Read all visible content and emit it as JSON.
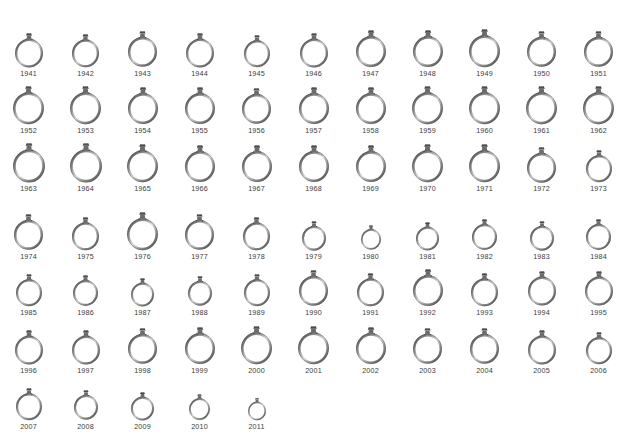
{
  "page": {
    "background_color": "#ffffff",
    "label_color": "#3c3c3c",
    "ring_metal_color": "#8a8a8a",
    "ring_metal_shadow_color": "#4a4a4a",
    "ring_metal_highlight_color": "#d8d8d8",
    "gem_color": "#6b6b6b",
    "item_count": 71,
    "column_count": 11,
    "row_count": 7,
    "year_range_label": "1941-2011"
  },
  "chart_data": {
    "type": "bar",
    "title": "",
    "subtitle": "",
    "xlabel": "",
    "ylabel": "",
    "legend": [],
    "grid": false,
    "note": "Each glyph is an engagement ring drawn at a diameter proportional to its value for that year; the year is printed beneath each ring.",
    "categories": [
      "1941",
      "1942",
      "1943",
      "1944",
      "1945",
      "1946",
      "1947",
      "1948",
      "1949",
      "1950",
      "1951",
      "1952",
      "1953",
      "1954",
      "1955",
      "1956",
      "1957",
      "1958",
      "1959",
      "1960",
      "1961",
      "1962",
      "1963",
      "1964",
      "1965",
      "1966",
      "1967",
      "1968",
      "1969",
      "1970",
      "1971",
      "1972",
      "1973",
      "1974",
      "1975",
      "1976",
      "1977",
      "1978",
      "1979",
      "1980",
      "1981",
      "1982",
      "1983",
      "1984",
      "1985",
      "1986",
      "1987",
      "1988",
      "1989",
      "1990",
      "1991",
      "1992",
      "1993",
      "1994",
      "1995",
      "1996",
      "1997",
      "1998",
      "1999",
      "2000",
      "2001",
      "2002",
      "2003",
      "2004",
      "2005",
      "2006",
      "2007",
      "2008",
      "2009",
      "2010",
      "2011"
    ],
    "values": [
      28,
      27,
      29,
      28,
      26,
      28,
      30,
      30,
      31,
      29,
      29,
      31,
      31,
      30,
      30,
      29,
      30,
      30,
      31,
      31,
      31,
      31,
      32,
      32,
      31,
      30,
      30,
      30,
      30,
      31,
      31,
      29,
      26,
      29,
      27,
      31,
      29,
      27,
      24,
      20,
      23,
      25,
      24,
      25,
      26,
      25,
      23,
      24,
      26,
      29,
      27,
      30,
      27,
      28,
      28,
      28,
      28,
      29,
      30,
      31,
      31,
      30,
      29,
      29,
      28,
      26,
      26,
      24,
      23,
      21,
      18
    ]
  },
  "rows": [
    {
      "row_index": 1,
      "top": 27,
      "items": [
        {
          "year": "1941",
          "diameter": 28
        },
        {
          "year": "1942",
          "diameter": 27
        },
        {
          "year": "1943",
          "diameter": 29
        },
        {
          "year": "1944",
          "diameter": 28
        },
        {
          "year": "1945",
          "diameter": 26
        },
        {
          "year": "1946",
          "diameter": 28
        },
        {
          "year": "1947",
          "diameter": 30
        },
        {
          "year": "1948",
          "diameter": 30
        },
        {
          "year": "1949",
          "diameter": 31
        },
        {
          "year": "1950",
          "diameter": 29
        },
        {
          "year": "1951",
          "diameter": 29
        }
      ]
    },
    {
      "row_index": 2,
      "top": 84,
      "items": [
        {
          "year": "1952",
          "diameter": 31
        },
        {
          "year": "1953",
          "diameter": 31
        },
        {
          "year": "1954",
          "diameter": 30
        },
        {
          "year": "1955",
          "diameter": 30
        },
        {
          "year": "1956",
          "diameter": 29
        },
        {
          "year": "1957",
          "diameter": 30
        },
        {
          "year": "1958",
          "diameter": 30
        },
        {
          "year": "1959",
          "diameter": 31
        },
        {
          "year": "1960",
          "diameter": 31
        },
        {
          "year": "1961",
          "diameter": 31
        },
        {
          "year": "1962",
          "diameter": 31
        }
      ]
    },
    {
      "row_index": 3,
      "top": 141,
      "items": [
        {
          "year": "1963",
          "diameter": 32
        },
        {
          "year": "1964",
          "diameter": 32
        },
        {
          "year": "1965",
          "diameter": 31
        },
        {
          "year": "1966",
          "diameter": 30
        },
        {
          "year": "1967",
          "diameter": 30
        },
        {
          "year": "1968",
          "diameter": 30
        },
        {
          "year": "1969",
          "diameter": 30
        },
        {
          "year": "1970",
          "diameter": 31
        },
        {
          "year": "1971",
          "diameter": 31
        },
        {
          "year": "1972",
          "diameter": 29
        },
        {
          "year": "1973",
          "diameter": 26
        }
      ]
    },
    {
      "row_index": 4,
      "top": 210,
      "items": [
        {
          "year": "1974",
          "diameter": 29
        },
        {
          "year": "1975",
          "diameter": 27
        },
        {
          "year": "1976",
          "diameter": 31
        },
        {
          "year": "1977",
          "diameter": 29
        },
        {
          "year": "1978",
          "diameter": 27
        },
        {
          "year": "1979",
          "diameter": 24
        },
        {
          "year": "1980",
          "diameter": 20
        },
        {
          "year": "1981",
          "diameter": 23
        },
        {
          "year": "1982",
          "diameter": 25
        },
        {
          "year": "1983",
          "diameter": 24
        },
        {
          "year": "1984",
          "diameter": 25
        }
      ]
    },
    {
      "row_index": 5,
      "top": 267,
      "items": [
        {
          "year": "1985",
          "diameter": 26
        },
        {
          "year": "1986",
          "diameter": 25
        },
        {
          "year": "1987",
          "diameter": 23
        },
        {
          "year": "1988",
          "diameter": 24
        },
        {
          "year": "1989",
          "diameter": 26
        },
        {
          "year": "1990",
          "diameter": 29
        },
        {
          "year": "1991",
          "diameter": 27
        },
        {
          "year": "1992",
          "diameter": 30
        },
        {
          "year": "1993",
          "diameter": 27
        },
        {
          "year": "1994",
          "diameter": 28
        },
        {
          "year": "1995",
          "diameter": 28
        }
      ]
    },
    {
      "row_index": 6,
      "top": 324,
      "items": [
        {
          "year": "1996",
          "diameter": 28
        },
        {
          "year": "1997",
          "diameter": 28
        },
        {
          "year": "1998",
          "diameter": 29
        },
        {
          "year": "1999",
          "diameter": 30
        },
        {
          "year": "2000",
          "diameter": 31
        },
        {
          "year": "2001",
          "diameter": 31
        },
        {
          "year": "2002",
          "diameter": 30
        },
        {
          "year": "2003",
          "diameter": 29
        },
        {
          "year": "2004",
          "diameter": 29
        },
        {
          "year": "2005",
          "diameter": 28
        },
        {
          "year": "2006",
          "diameter": 26
        }
      ]
    },
    {
      "row_index": 7,
      "top": 386,
      "items": [
        {
          "year": "2007",
          "diameter": 26
        },
        {
          "year": "2008",
          "diameter": 24
        },
        {
          "year": "2009",
          "diameter": 23
        },
        {
          "year": "2010",
          "diameter": 21
        },
        {
          "year": "2011",
          "diameter": 18
        }
      ]
    }
  ]
}
